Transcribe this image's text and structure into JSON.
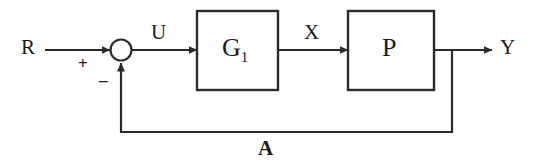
{
  "diagram": {
    "type": "block-diagram",
    "canvas": {
      "width": 538,
      "height": 165,
      "background": "#ffffff"
    },
    "stroke_color": "#2b2b2b",
    "text_color": "#1a1a1a",
    "signals": {
      "input": "R",
      "error": "U",
      "intermediate": "X",
      "output": "Y",
      "feedback": "A"
    },
    "summing_junction": {
      "name": "summing-junction",
      "plus_sign": "+",
      "minus_sign": "–",
      "cx": 121,
      "cy": 50,
      "r": 10
    },
    "blocks": [
      {
        "id": "g1",
        "label_main": "G",
        "label_sub": "1",
        "x": 197,
        "y": 11,
        "width": 81,
        "height": 79
      },
      {
        "id": "p",
        "label_main": "P",
        "label_sub": "",
        "x": 348,
        "y": 11,
        "width": 86,
        "height": 79
      }
    ],
    "labels": {
      "r": "R",
      "u": "U",
      "x": "X",
      "y": "Y",
      "a": "A",
      "plus": "+",
      "minus": "–",
      "g1_main": "G",
      "g1_sub": "1",
      "p_main": "P"
    }
  }
}
